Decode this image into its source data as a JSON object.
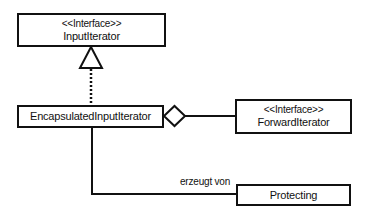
{
  "diagram": {
    "type": "UML class diagram",
    "classes": [
      {
        "id": "input-iterator",
        "stereotype": "<<Interface>>",
        "name": "InputIterator"
      },
      {
        "id": "encapsulated-input-iterator",
        "stereotype": "",
        "name": "EncapsulatedInputIterator"
      },
      {
        "id": "forward-iterator",
        "stereotype": "<<Interface>>",
        "name": "ForwardIterator"
      },
      {
        "id": "protecting",
        "stereotype": "",
        "name": "Protecting"
      }
    ],
    "relations": [
      {
        "type": "realization",
        "from": "EncapsulatedInputIterator",
        "to": "InputIterator",
        "label": ""
      },
      {
        "type": "aggregation",
        "from": "EncapsulatedInputIterator",
        "to": "ForwardIterator",
        "label": ""
      },
      {
        "type": "association",
        "from": "EncapsulatedInputIterator",
        "to": "Protecting",
        "label": "erzeugt von"
      }
    ],
    "colors": {
      "line": "#111111",
      "background": "#ffffff"
    }
  }
}
